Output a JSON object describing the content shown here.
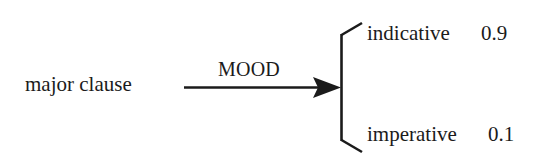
{
  "diagram": {
    "type": "system-network",
    "source": {
      "label": "major clause"
    },
    "system": {
      "name": "MOOD"
    },
    "features": [
      {
        "label": "indicative",
        "probability": "0.9"
      },
      {
        "label": "imperative",
        "probability": "0.1"
      }
    ],
    "colors": {
      "ink": "#1b1b1b",
      "background": "#ffffff"
    }
  }
}
